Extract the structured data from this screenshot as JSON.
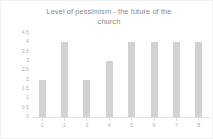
{
  "chart_data": {
    "type": "bar",
    "title": "Level of pessimism - the future of the\nchurch",
    "categories": [
      "1",
      "2",
      "3",
      "4",
      "5",
      "6",
      "7",
      "8"
    ],
    "values": [
      2,
      4,
      2,
      3,
      4,
      4,
      4,
      4
    ],
    "xlabel": "",
    "ylabel": "",
    "ylim": [
      0,
      4.5
    ],
    "yticks": [
      "4.5",
      "4",
      "3.5",
      "3",
      "2.5",
      "2",
      "1.5",
      "1",
      "0.5",
      "0"
    ],
    "ytick_values": [
      4.5,
      4,
      3.5,
      3,
      2.5,
      2,
      1.5,
      1,
      0.5,
      0
    ],
    "grid": false,
    "legend": false,
    "legend_position": "none",
    "bar_color": "#d2d2d2",
    "text_color": "#b2b2b2",
    "title_color": "#8a8a8a",
    "background": "#ffffff"
  }
}
